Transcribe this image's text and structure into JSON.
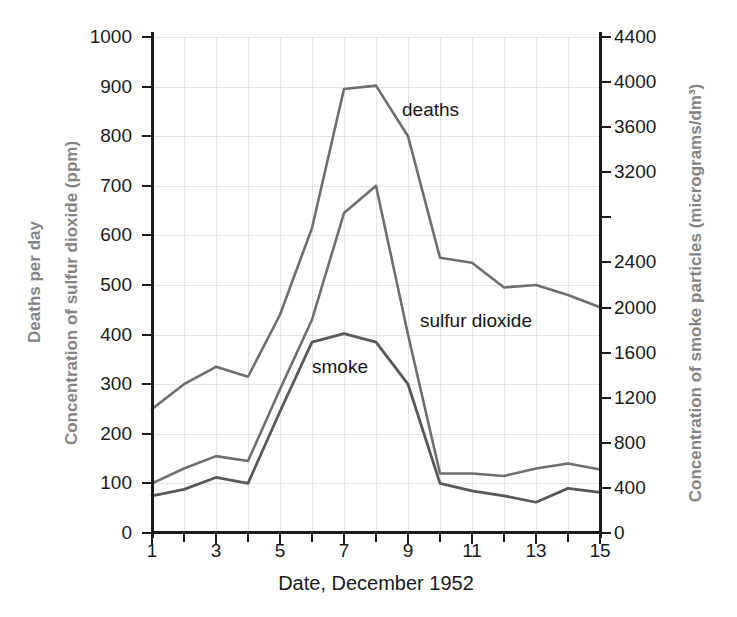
{
  "chart_data": {
    "type": "line",
    "title": "",
    "xlabel": "Date, December 1952",
    "ylabel_left_line1": "Deaths per day",
    "ylabel_left_line2": "Concentration of sulfur dioxide (ppm)",
    "ylabel_right": "Concentration of smoke particles (micrograms/dm³)",
    "x": [
      1,
      2,
      3,
      4,
      5,
      6,
      7,
      8,
      9,
      10,
      11,
      12,
      13,
      14,
      15
    ],
    "xlim": [
      1,
      15
    ],
    "xticks": [
      1,
      2,
      3,
      4,
      5,
      6,
      7,
      8,
      9,
      10,
      11,
      12,
      13,
      14,
      15
    ],
    "xticklabels": [
      "1",
      "",
      "3",
      "",
      "5",
      "",
      "7",
      "",
      "9",
      "",
      "11",
      "",
      "13",
      "",
      "15"
    ],
    "ylim_left": [
      0,
      1000
    ],
    "yticks_left": [
      0,
      100,
      200,
      300,
      400,
      500,
      600,
      700,
      800,
      900,
      1000
    ],
    "yticklabels_left": [
      "0",
      "100",
      "200",
      "300",
      "400",
      "500",
      "600",
      "700",
      "800",
      "900",
      "1000"
    ],
    "ylim_right": [
      0,
      4400
    ],
    "yticks_right": [
      0,
      400,
      800,
      1200,
      1600,
      2000,
      2400,
      2800,
      3200,
      3600,
      4000,
      4400
    ],
    "yticklabels_right": [
      "0",
      "400",
      "800",
      "1200",
      "1600",
      "2000",
      "2400",
      "",
      "3200",
      "3600",
      "4000",
      "4400"
    ],
    "grid": true,
    "legend": "inline-annotations",
    "series": [
      {
        "name": "deaths",
        "axis": "left",
        "color": "#6e6e6e",
        "values": [
          250,
          300,
          335,
          315,
          440,
          615,
          895,
          902,
          800,
          555,
          545,
          495,
          500,
          480,
          455
        ]
      },
      {
        "name": "sulfur dioxide",
        "axis": "left",
        "color": "#6e6e6e",
        "values": [
          100,
          130,
          155,
          145,
          290,
          430,
          645,
          700,
          400,
          120,
          120,
          115,
          130,
          140,
          128
        ]
      },
      {
        "name": "smoke",
        "axis": "right",
        "color": "#585858",
        "values_left_scale": [
          75,
          88,
          112,
          100,
          245,
          385,
          402,
          385,
          300,
          100,
          85,
          75,
          62,
          90,
          82
        ],
        "values": [
          330,
          387,
          493,
          440,
          1078,
          1694,
          1769,
          1694,
          1320,
          440,
          374,
          330,
          273,
          396,
          361
        ]
      }
    ],
    "annotations": [
      {
        "text": "deaths",
        "x": 8.6,
        "y": 870
      },
      {
        "text": "sulfur dioxide",
        "x": 9.2,
        "y": 440
      },
      {
        "text": "smoke",
        "x": 6.0,
        "y": 350
      }
    ]
  },
  "colors": {
    "axis": "#1a1a1a",
    "grid": "#e3e3e3",
    "axis_title": "#838383",
    "background": "#ffffff"
  }
}
